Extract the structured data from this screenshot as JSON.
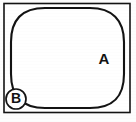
{
  "figure": {
    "type": "line-drawing",
    "background_color": "#fdfdfd",
    "ink_color": "#131313",
    "frame": {
      "name": "outer-rectangle-border",
      "x": 4,
      "y": 3.5,
      "width": 126,
      "height": 109,
      "stroke_width": 1.6,
      "fill": "#ffffff"
    },
    "shapes": [
      {
        "name": "rounded-square-region",
        "kind": "squircle",
        "x": 11,
        "y": 8,
        "width": 113,
        "height": 100,
        "corner_radius": 34,
        "stroke_width": 2.1,
        "fill": "#ffffff"
      }
    ],
    "labels": [
      {
        "id": "label-a",
        "text": "A",
        "circled": false,
        "x": 104,
        "y": 60,
        "font_size": 15
      },
      {
        "id": "label-b",
        "text": "B",
        "circled": true,
        "x": 16,
        "y": 99,
        "font_size": 14,
        "circle_radius": 10,
        "circle_stroke_width": 1.7
      }
    ]
  }
}
